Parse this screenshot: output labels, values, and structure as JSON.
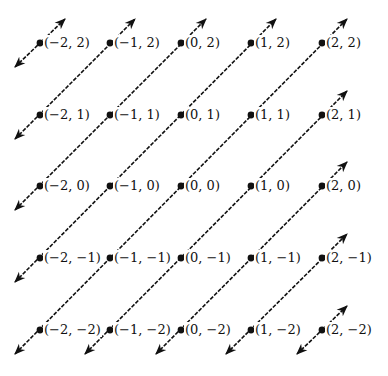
{
  "diagram": {
    "title": "",
    "colors": {
      "background": "#ffffff",
      "line": "#111111",
      "dot": "#111111",
      "text": "#111111"
    },
    "x_values": [
      -2,
      -1,
      0,
      1,
      2
    ],
    "y_values": [
      2,
      1,
      0,
      -1,
      -2
    ],
    "column_px": [
      40,
      110,
      181,
      251,
      322
    ],
    "row_px": [
      43,
      115,
      186,
      258,
      330
    ],
    "points": [
      {
        "x": -2,
        "y": 2,
        "label": "(−2, 2)"
      },
      {
        "x": -1,
        "y": 2,
        "label": "(−1, 2)"
      },
      {
        "x": 0,
        "y": 2,
        "label": "(0, 2)"
      },
      {
        "x": 1,
        "y": 2,
        "label": "(1, 2)"
      },
      {
        "x": 2,
        "y": 2,
        "label": "(2, 2)"
      },
      {
        "x": -2,
        "y": 1,
        "label": "(−2, 1)"
      },
      {
        "x": -1,
        "y": 1,
        "label": "(−1, 1)"
      },
      {
        "x": 0,
        "y": 1,
        "label": "(0, 1)"
      },
      {
        "x": 1,
        "y": 1,
        "label": "(1, 1)"
      },
      {
        "x": 2,
        "y": 1,
        "label": "(2, 1)"
      },
      {
        "x": -2,
        "y": 0,
        "label": "(−2, 0)"
      },
      {
        "x": -1,
        "y": 0,
        "label": "(−1, 0)"
      },
      {
        "x": 0,
        "y": 0,
        "label": "(0, 0)"
      },
      {
        "x": 1,
        "y": 0,
        "label": "(1, 0)"
      },
      {
        "x": 2,
        "y": 0,
        "label": "(2, 0)"
      },
      {
        "x": -2,
        "y": -1,
        "label": "(−2, −1)"
      },
      {
        "x": -1,
        "y": -1,
        "label": "(−1, −1)"
      },
      {
        "x": 0,
        "y": -1,
        "label": "(0, −1)"
      },
      {
        "x": 1,
        "y": -1,
        "label": "(1, −1)"
      },
      {
        "x": 2,
        "y": -1,
        "label": "(2, −1)"
      },
      {
        "x": -2,
        "y": -2,
        "label": "(−2, −2)"
      },
      {
        "x": -1,
        "y": -2,
        "label": "(−1, −2)"
      },
      {
        "x": 0,
        "y": -2,
        "label": "(0, −2)"
      },
      {
        "x": 1,
        "y": -2,
        "label": "(1, −2)"
      },
      {
        "x": 2,
        "y": -2,
        "label": "(2, −2)"
      }
    ],
    "lines": [
      {
        "name": "x-minus-y-eq-neg4",
        "diff": -4,
        "arrows": "both"
      },
      {
        "name": "x-minus-y-eq-neg3",
        "diff": -3,
        "arrows": "both"
      },
      {
        "name": "x-minus-y-eq-neg2",
        "diff": -2,
        "arrows": "both"
      },
      {
        "name": "x-minus-y-eq-neg1",
        "diff": -1,
        "arrows": "both"
      },
      {
        "name": "x-minus-y-eq-0",
        "diff": 0,
        "arrows": "both"
      },
      {
        "name": "x-minus-y-eq-1",
        "diff": 1,
        "arrows": "both"
      },
      {
        "name": "x-minus-y-eq-2",
        "diff": 2,
        "arrows": "both"
      },
      {
        "name": "x-minus-y-eq-3",
        "diff": 3,
        "arrows": "both"
      },
      {
        "name": "x-minus-y-eq-4",
        "diff": 4,
        "arrows": "both"
      }
    ],
    "line_style": "dashed",
    "arrow_extension_px": {
      "dx": 25,
      "dy": 24
    }
  }
}
